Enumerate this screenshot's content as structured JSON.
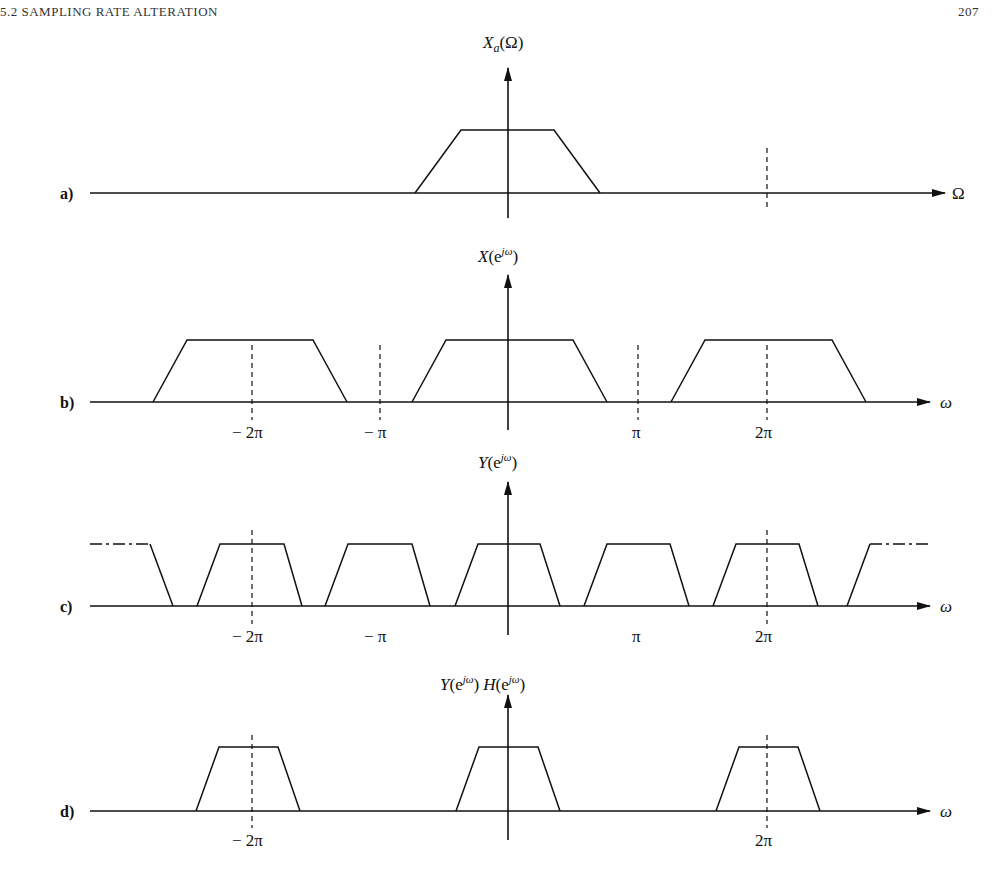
{
  "header": {
    "section": "5.2   SAMPLING RATE ALTERATION",
    "page_number": "207"
  },
  "panels": [
    {
      "id": "a",
      "label": "a)",
      "y_axis_label": "X_a(Ω)",
      "x_axis_label": "Ω",
      "tick_labels": []
    },
    {
      "id": "b",
      "label": "b)",
      "y_axis_label": "X(e^{jω})",
      "x_axis_label": "ω",
      "tick_labels": [
        "− 2π",
        "− π",
        "π",
        "2π"
      ]
    },
    {
      "id": "c",
      "label": "c)",
      "y_axis_label": "Y(e^{jω})",
      "x_axis_label": "ω",
      "tick_labels": [
        "− 2π",
        "− π",
        "π",
        "2π"
      ]
    },
    {
      "id": "d",
      "label": "d)",
      "y_axis_label": "Y(e^{jω}) H(e^{jω})",
      "x_axis_label": "ω",
      "tick_labels": [
        "− 2π",
        "2π"
      ]
    }
  ],
  "text": {
    "a_label": "a)",
    "b_label": "b)",
    "c_label": "c)",
    "d_label": "d)",
    "omega_cap": "Ω",
    "omega": "ω",
    "neg2pi": "− 2π",
    "negpi": "− π",
    "pi": "π",
    "twopi": "2π",
    "Xa": "X",
    "Xa_sub": "a",
    "Xa_arg": "(Ω)",
    "X": "X",
    "Y": "Y",
    "H": "H",
    "ejw_open": "(e",
    "ejw_sup": "jω",
    "close": ")"
  }
}
